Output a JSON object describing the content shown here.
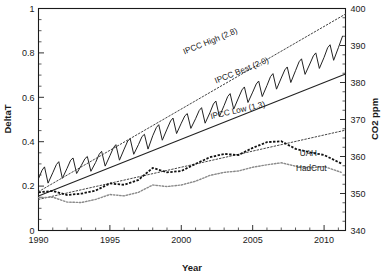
{
  "chart_data": {
    "type": "line",
    "title": "",
    "xlabel": "Year",
    "ylabel": "DeltaT",
    "y2label": "CO2 ppm",
    "xlim": [
      1990,
      2011.5
    ],
    "ylim": [
      0,
      1
    ],
    "y2lim": [
      340,
      400
    ],
    "grid": false,
    "legend_position": "inline-annotations",
    "xticks": [
      1990,
      1995,
      2000,
      2005,
      2010
    ],
    "xtick_labels": [
      "1990",
      "1995",
      "2000",
      "2005",
      "2010"
    ],
    "xtick_minor_step": 1,
    "yticks": [
      0,
      0.2,
      0.4,
      0.6,
      0.8,
      1
    ],
    "ytick_labels": [
      "0",
      "0.2",
      "0.4",
      "0.6",
      "0.8",
      "1"
    ],
    "ytick_minor_step": 0.05,
    "y2ticks": [
      340,
      350,
      360,
      370,
      380,
      390,
      400
    ],
    "y2tick_labels": [
      "340",
      "350",
      "360",
      "370",
      "380",
      "390",
      "400"
    ],
    "y2tick_minor_step": 2.5,
    "annotations": [
      {
        "name": "ipcc-high-label",
        "text": "IPCC High (2.8)",
        "x": 2002.1,
        "y2": 390.5,
        "rotation": -22
      },
      {
        "name": "ipcc-best-label",
        "text": "IPCC Best (2.0)",
        "x": 2004.3,
        "y2": 382.6,
        "rotation": -22
      },
      {
        "name": "ipcc-low-label",
        "text": "IPCC Low (1.3)",
        "x": 2004.0,
        "y2": 371.8,
        "rotation": -13
      },
      {
        "name": "uah-label",
        "text": "UAH",
        "x": 2008.9,
        "y": 0.335,
        "rotation": 0
      },
      {
        "name": "hadcrut-label",
        "text": "HadCrut",
        "x": 2009.1,
        "y": 0.268,
        "rotation": 0
      }
    ],
    "series": [
      {
        "name": "CO2 Mauna Loa (monthly, sawtooth)",
        "axis": "y2",
        "style": "solid-thin",
        "units": "ppm",
        "x": [
          1990.0,
          1990.25,
          1990.42,
          1990.67,
          1991.0,
          1991.25,
          1991.42,
          1991.67,
          1992.0,
          1992.25,
          1992.42,
          1992.67,
          1993.0,
          1993.25,
          1993.42,
          1993.67,
          1994.0,
          1994.25,
          1994.42,
          1994.67,
          1995.0,
          1995.25,
          1995.42,
          1995.67,
          1996.0,
          1996.25,
          1996.42,
          1996.67,
          1997.0,
          1997.25,
          1997.42,
          1997.67,
          1998.0,
          1998.25,
          1998.42,
          1998.67,
          1999.0,
          1999.25,
          1999.42,
          1999.67,
          2000.0,
          2000.25,
          2000.42,
          2000.67,
          2001.0,
          2001.25,
          2001.42,
          2001.67,
          2002.0,
          2002.25,
          2002.42,
          2002.67,
          2003.0,
          2003.25,
          2003.42,
          2003.67,
          2004.0,
          2004.25,
          2004.42,
          2004.67,
          2005.0,
          2005.25,
          2005.42,
          2005.67,
          2006.0,
          2006.25,
          2006.42,
          2006.67,
          2007.0,
          2007.25,
          2007.42,
          2007.67,
          2008.0,
          2008.25,
          2008.42,
          2008.67,
          2009.0,
          2009.25,
          2009.42,
          2009.67,
          2010.0,
          2010.25,
          2010.42,
          2010.67,
          2011.0,
          2011.3
        ],
        "values": [
          354.0,
          356.3,
          357.2,
          352.8,
          355.6,
          357.8,
          358.6,
          354.1,
          356.8,
          359.0,
          359.6,
          355.4,
          357.6,
          359.4,
          360.0,
          356.0,
          358.4,
          360.6,
          361.4,
          357.4,
          360.2,
          362.4,
          363.2,
          359.0,
          362.0,
          364.2,
          364.8,
          360.6,
          363.2,
          365.4,
          366.0,
          362.0,
          365.6,
          367.8,
          368.6,
          364.4,
          367.4,
          369.6,
          370.4,
          366.2,
          369.0,
          371.0,
          371.6,
          367.6,
          370.2,
          372.4,
          373.2,
          369.0,
          371.8,
          374.2,
          375.0,
          370.8,
          373.8,
          376.2,
          377.0,
          372.8,
          375.8,
          378.0,
          378.8,
          374.6,
          377.4,
          379.6,
          380.4,
          376.2,
          379.2,
          381.6,
          382.4,
          378.2,
          381.2,
          383.4,
          384.2,
          380.0,
          383.2,
          385.6,
          386.4,
          382.2,
          385.0,
          387.2,
          388.0,
          383.8,
          386.8,
          389.4,
          390.2,
          386.0,
          389.4,
          392.6
        ]
      },
      {
        "name": "IPCC High (2.8)",
        "axis": "y",
        "style": "dotted",
        "sensitivity": 2.8,
        "x": [
          1990,
          2011.5
        ],
        "values": [
          0.175,
          0.975
        ]
      },
      {
        "name": "IPCC Best (2.0)",
        "axis": "y",
        "style": "solid",
        "sensitivity": 2.0,
        "x": [
          1990,
          2011.5
        ],
        "values": [
          0.155,
          0.705
        ]
      },
      {
        "name": "IPCC Low (1.3)",
        "axis": "y",
        "style": "dotted",
        "sensitivity": 1.3,
        "x": [
          1990,
          2011.5
        ],
        "values": [
          0.14,
          0.452
        ]
      },
      {
        "name": "UAH",
        "axis": "y",
        "style": "dotted-grey",
        "x": [
          1990,
          1991,
          1992,
          1993,
          1994,
          1995,
          1996,
          1997,
          1998,
          1999,
          2000,
          2001,
          2002,
          2003,
          2004,
          2005,
          2006,
          2007,
          2008,
          2009,
          2010,
          2011.2
        ],
        "values": [
          0.148,
          0.15,
          0.128,
          0.126,
          0.14,
          0.162,
          0.156,
          0.172,
          0.205,
          0.198,
          0.205,
          0.222,
          0.248,
          0.262,
          0.268,
          0.285,
          0.296,
          0.305,
          0.29,
          0.282,
          0.288,
          0.262
        ]
      },
      {
        "name": "HadCrut",
        "axis": "y",
        "style": "dashed-bold",
        "x": [
          1990,
          1991,
          1992,
          1993,
          1994,
          1995,
          1996,
          1997,
          1998,
          1999,
          2000,
          2001,
          2002,
          2003,
          2004,
          2005,
          2006,
          2007,
          2008,
          2009,
          2010,
          2011.2
        ],
        "values": [
          0.172,
          0.178,
          0.16,
          0.166,
          0.18,
          0.212,
          0.206,
          0.228,
          0.282,
          0.262,
          0.268,
          0.3,
          0.33,
          0.345,
          0.34,
          0.372,
          0.398,
          0.402,
          0.368,
          0.352,
          0.34,
          0.302
        ]
      }
    ]
  },
  "colors": {
    "axis": "#1a1a1a",
    "co2_curve": "#222222",
    "uah": "#8a8a8a",
    "hadcrut": "#111111",
    "ipcc_dotted": "#444444"
  }
}
